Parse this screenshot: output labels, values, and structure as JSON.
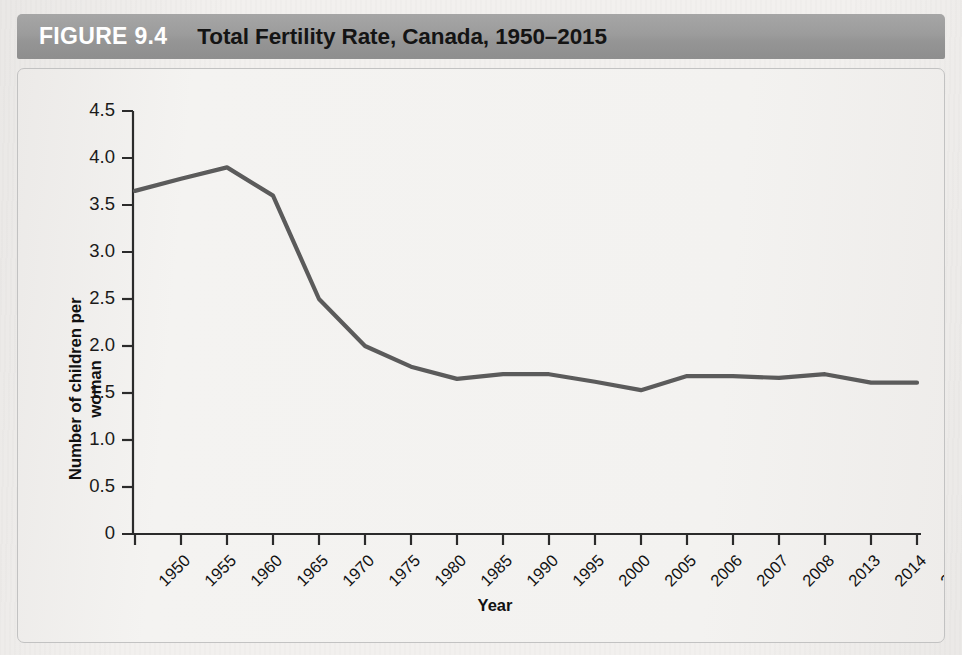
{
  "figure": {
    "number": "FIGURE 9.4",
    "title": "Total Fertility Rate, Canada, 1950–2015"
  },
  "colors": {
    "header_bar": "#9a9a9a",
    "figure_number_text": "#ffffff",
    "title_text": "#141414",
    "line": "#5b5b5b",
    "axis": "#2b2b2b",
    "panel_background": "#f3f2f0",
    "page_background": "#f2f0ee",
    "panel_border": "#c2c2c2"
  },
  "chart_data": {
    "type": "line",
    "title": "Total Fertility Rate, Canada, 1950–2015",
    "xlabel": "Year",
    "ylabel": "Number of children per woman",
    "categories": [
      "1950",
      "1955",
      "1960",
      "1965",
      "1970",
      "1975",
      "1980",
      "1985",
      "1990",
      "1995",
      "2000",
      "2005",
      "2006",
      "2007",
      "2008",
      "2013",
      "2014",
      "2015"
    ],
    "values": [
      3.65,
      3.78,
      3.9,
      3.6,
      2.5,
      2.0,
      1.78,
      1.65,
      1.7,
      1.7,
      1.62,
      1.53,
      1.68,
      1.68,
      1.66,
      1.7,
      1.61,
      1.61
    ],
    "series": [
      {
        "name": "Total fertility rate",
        "values": [
          3.65,
          3.78,
          3.9,
          3.6,
          2.5,
          2.0,
          1.78,
          1.65,
          1.7,
          1.7,
          1.62,
          1.53,
          1.68,
          1.68,
          1.66,
          1.7,
          1.61,
          1.61
        ]
      }
    ],
    "ylim": [
      0,
      4.5
    ],
    "yticks": [
      0,
      0.5,
      1.0,
      1.5,
      2.0,
      2.5,
      3.0,
      3.5,
      4.0,
      4.5
    ],
    "ytick_labels": [
      "0",
      "0.5",
      "1.0",
      "1.5",
      "2.0",
      "2.5",
      "3.0",
      "3.5",
      "4.0",
      "4.5"
    ],
    "grid": false,
    "legend": "none",
    "xtick_rotation": -45,
    "marker": "none"
  }
}
